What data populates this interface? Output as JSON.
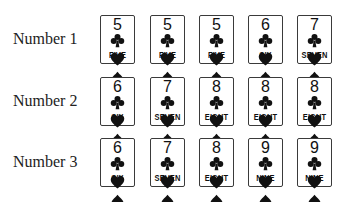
{
  "rows": [
    {
      "label": "Number 1",
      "cards": [
        {
          "rank": "5",
          "suit": "clubs",
          "name": "FIVE"
        },
        {
          "rank": "5",
          "suit": "hearts",
          "name": "FIVE"
        },
        {
          "rank": "5",
          "suit": "spades",
          "name": "FIVE"
        },
        {
          "rank": "6",
          "suit": "clubs",
          "name": "SIX"
        },
        {
          "rank": "7",
          "suit": "diamonds",
          "name": "SEVEN"
        }
      ]
    },
    {
      "label": "Number 2",
      "cards": [
        {
          "rank": "6",
          "suit": "spades",
          "name": "SIX"
        },
        {
          "rank": "7",
          "suit": "diamonds",
          "name": "SEVEN"
        },
        {
          "rank": "8",
          "suit": "spades",
          "name": "EIGHT"
        },
        {
          "rank": "8",
          "suit": "diamonds",
          "name": "EIGHT"
        },
        {
          "rank": "8",
          "suit": "clubs",
          "name": "EIGHT"
        }
      ]
    },
    {
      "label": "Number 3",
      "cards": [
        {
          "rank": "6",
          "suit": "diamonds",
          "name": "SIX"
        },
        {
          "rank": "7",
          "suit": "spades",
          "name": "SEVEN"
        },
        {
          "rank": "8",
          "suit": "hearts",
          "name": "EIGHT"
        },
        {
          "rank": "9",
          "suit": "spades",
          "name": "NINE"
        },
        {
          "rank": "9",
          "suit": "hearts",
          "name": "NINE"
        }
      ]
    }
  ],
  "colors": {
    "card_border": "#3a3a3a",
    "suit_fill": "#111111",
    "label_text": "#222222"
  }
}
